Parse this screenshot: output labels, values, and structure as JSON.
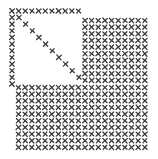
{
  "canvas": {
    "width": 158,
    "height": 159,
    "background": "#ffffff",
    "mark_color": "#3a3a3a"
  },
  "mark": {
    "glyph": "cross-stitch",
    "size": 4.2,
    "pitch": 6.65
  },
  "triangle": {
    "top_row": {
      "y": 11,
      "x_start": 12,
      "count": 11
    },
    "left_col": {
      "x": 12,
      "y_start": 17.5,
      "count": 11
    },
    "diagonal": {
      "x_start": 19,
      "y_start": 17.5,
      "count": 10
    }
  },
  "right_block": {
    "x_start": 85,
    "y_start": 20.5,
    "cols": 10,
    "rows": 10
  },
  "bottom_block": {
    "x_start": 18.5,
    "y_start": 87.5,
    "cols": 20,
    "rows": 10
  }
}
